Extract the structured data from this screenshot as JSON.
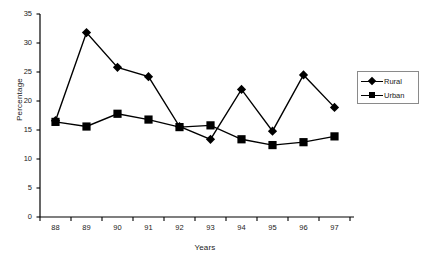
{
  "chart_data": {
    "type": "line",
    "title": "",
    "xlabel": "Years",
    "ylabel": "Percentage",
    "categories": [
      "88",
      "89",
      "90",
      "91",
      "92",
      "93",
      "94",
      "95",
      "96",
      "97"
    ],
    "ylim": [
      0,
      35
    ],
    "yticks": [
      0,
      5,
      10,
      15,
      20,
      25,
      30,
      35
    ],
    "grid": false,
    "legend_position": "right",
    "series": [
      {
        "name": "Rural",
        "marker": "diamond",
        "color": "#000000",
        "values": [
          16.6,
          31.8,
          25.8,
          24.2,
          15.6,
          13.4,
          22.0,
          14.8,
          24.5,
          18.9
        ]
      },
      {
        "name": "Urban",
        "marker": "square",
        "color": "#000000",
        "values": [
          16.4,
          15.6,
          17.8,
          16.8,
          15.5,
          15.8,
          13.4,
          12.4,
          12.9,
          13.9
        ]
      }
    ]
  },
  "legend": {
    "entries": [
      {
        "label": "Rural",
        "marker": "diamond"
      },
      {
        "label": "Urban",
        "marker": "square"
      }
    ]
  }
}
